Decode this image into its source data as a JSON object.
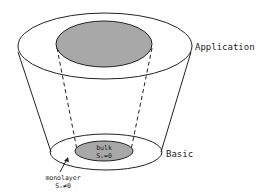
{
  "diagram": {
    "labels": {
      "top_level": "Application",
      "bottom_level": "Basic",
      "inner_bulk": "bulk",
      "inner_bulk_eq": "Sᵢ=0",
      "monolayer": "monolayer",
      "monolayer_eq": "Sᵢ≠0"
    },
    "colors": {
      "stroke": "#222222",
      "fill_inner": "#a8a8a8",
      "background": "#ffffff"
    }
  }
}
